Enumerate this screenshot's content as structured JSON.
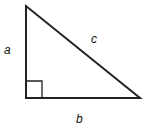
{
  "diagram": {
    "type": "right-triangle",
    "vertices": {
      "top": [
        26,
        6
      ],
      "right_angle": [
        26,
        98
      ],
      "bottom_right": [
        140,
        98
      ]
    },
    "right_angle_marker_size": 16,
    "labels": {
      "a": "a",
      "b": "b",
      "c": "c"
    },
    "stroke_color": "#222222"
  }
}
